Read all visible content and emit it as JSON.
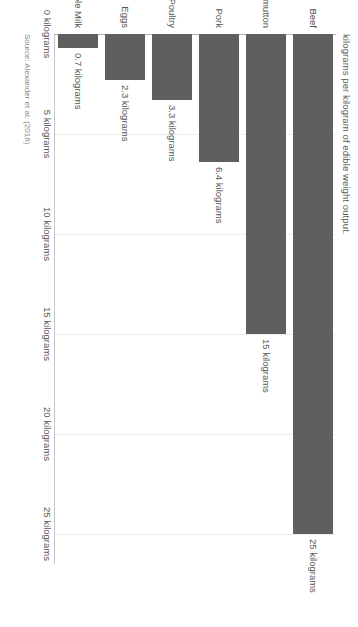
{
  "chart_data": {
    "type": "bar",
    "orientation": "horizontal",
    "title": "",
    "subtitle": "kilograms per kilogram of edible weight output.",
    "xlabel": "",
    "ylabel": "",
    "categories": [
      "Beef",
      "Lamb/mutton",
      "Pork",
      "Poultry",
      "Eggs",
      "Whole Milk"
    ],
    "values": [
      25,
      15,
      6.4,
      3.3,
      2.3,
      0.7
    ],
    "value_labels": [
      "25 kilograms",
      "15 kilograms",
      "6.4 kilograms",
      "3.3 kilograms",
      "2.3 kilograms",
      "0.7 kilograms"
    ],
    "tick_values": [
      0,
      5,
      10,
      15,
      20,
      25
    ],
    "tick_labels": [
      "0 kilograms",
      "5 kilograms",
      "10 kilograms",
      "15 kilograms",
      "20 kilograms",
      "25 kilograms"
    ],
    "xlim": [
      0,
      26.5
    ],
    "grid": true,
    "legend": "none",
    "bar_color": "#5f5f5f",
    "gridline_color": "#ededed",
    "axis_color": "#c8c8c8",
    "text_color": "#555555",
    "background": "#ffffff"
  },
  "source": {
    "text": "Source: Alexander et al. (2016)"
  }
}
